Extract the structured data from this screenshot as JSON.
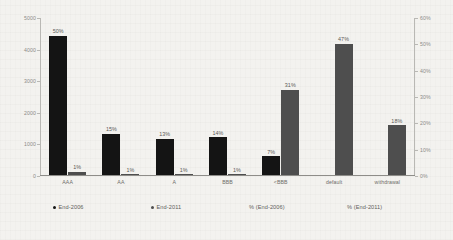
{
  "chart_data": {
    "type": "bar",
    "title": "",
    "subtitle": "",
    "xlabel": "",
    "ylabel": "",
    "y2label": "",
    "categories": [
      "AAA",
      "AA",
      "A",
      "BBB",
      "<BBB",
      "default",
      "withdrawal"
    ],
    "ylim": [
      0,
      5000
    ],
    "y2lim": [
      0,
      60
    ],
    "left_axis_ticks": [
      "0",
      "1000",
      "2000",
      "3000",
      "4000",
      "5000"
    ],
    "right_axis_ticks": [
      "0%",
      "10%",
      "20%",
      "30%",
      "40%",
      "50%",
      "60%"
    ],
    "grid": false,
    "legend_position": "bottom",
    "series": [
      {
        "name": "End-2006",
        "axis": "left",
        "color": "#141414",
        "values": [
          4400,
          1310,
          1150,
          1190,
          600,
          null,
          null
        ],
        "labels": [
          "50%",
          "15%",
          "13%",
          "14%",
          "7%",
          "",
          ""
        ]
      },
      {
        "name": "End-2011",
        "axis": "left",
        "color": "#4e4e4e",
        "values": [
          100,
          30,
          25,
          25,
          2700,
          4150,
          1580
        ],
        "labels": [
          "1%",
          "1%",
          "1%",
          "1%",
          "31%",
          "47%",
          "18%"
        ]
      }
    ],
    "legend": [
      {
        "label": "End-2006",
        "color": "#141414"
      },
      {
        "label": "End-2011",
        "color": "#4e4e4e"
      },
      {
        "label": "% (End-2006)",
        "color": "#8c8c8c"
      },
      {
        "label": "% (End-2011)",
        "color": "#8c8c8c"
      }
    ],
    "percent_series": [
      {
        "name": "% (End-2006)",
        "values": [
          50,
          15,
          13,
          14,
          7,
          null,
          null
        ]
      },
      {
        "name": "% (End-2011)",
        "values": [
          1,
          1,
          1,
          1,
          31,
          47,
          18
        ]
      }
    ]
  }
}
